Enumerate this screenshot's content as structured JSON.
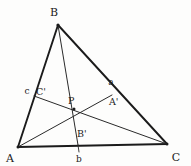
{
  "figure": {
    "kind": "geometry-diagram",
    "background_color": "#fdfdfc",
    "stroke_color": "#1b1b1b",
    "canvas": {
      "width": 191,
      "height": 166
    }
  },
  "points": {
    "A": {
      "label": "A",
      "x": 18,
      "y": 147
    },
    "B": {
      "label": "B",
      "x": 58,
      "y": 25
    },
    "C": {
      "label": "C",
      "x": 167,
      "y": 144
    },
    "Ap": {
      "label": "A'",
      "x": 112,
      "y": 95
    },
    "Bp": {
      "label": "B'",
      "x": 78,
      "y": 145
    },
    "Cp": {
      "label": "C'",
      "x": 34,
      "y": 96
    },
    "P": {
      "label": "P",
      "x": 74,
      "y": 109
    }
  },
  "point_labels": {
    "A": {
      "text": "A",
      "x": 10,
      "y": 160
    },
    "B": {
      "text": "B",
      "x": 54,
      "y": 16
    },
    "C": {
      "text": "C",
      "x": 172,
      "y": 159
    },
    "Ap": {
      "text": "A'",
      "x": 109,
      "y": 104
    },
    "Bp": {
      "text": "B'",
      "x": 76,
      "y": 137
    },
    "Cp": {
      "text": "C'",
      "x": 36,
      "y": 94
    },
    "P": {
      "text": "P",
      "x": 69,
      "y": 104
    }
  },
  "side_labels": {
    "a": {
      "text": "a",
      "x": 110,
      "y": 83,
      "near": "side-BC"
    },
    "b": {
      "text": "b",
      "x": 77,
      "y": 160,
      "near": "side-AC"
    },
    "c": {
      "text": "c",
      "x": 25,
      "y": 93,
      "near": "side-AB"
    }
  },
  "segments": [
    {
      "name": "side-AB",
      "from": "A",
      "to": "B",
      "width": 1.9
    },
    {
      "name": "side-BC",
      "from": "B",
      "to": "C",
      "width": 1.9
    },
    {
      "name": "side-AC",
      "from": "A",
      "to": "C",
      "width": 1.9
    },
    {
      "name": "cevian-AA-prime",
      "from": "A",
      "to": "Ap",
      "width": 1.0
    },
    {
      "name": "cevian-BB-prime",
      "from": "B",
      "to": "Bp",
      "width": 1.0
    },
    {
      "name": "cevian-CC-prime",
      "from": "Cp",
      "to": "C",
      "width": 1.0
    }
  ],
  "tick": {
    "name": "b-foot-tick",
    "x1": 78,
    "y1": 145,
    "x2": 79,
    "y2": 152
  }
}
